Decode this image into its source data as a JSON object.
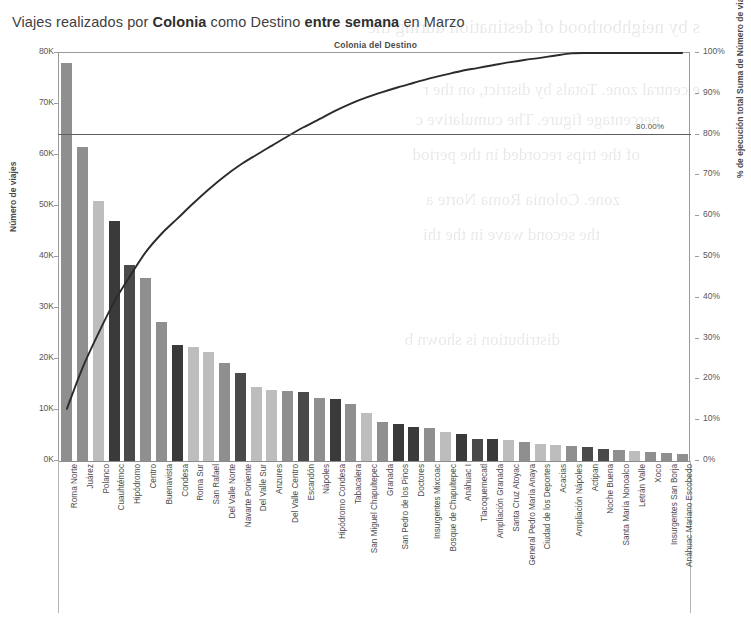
{
  "title": {
    "prefix": "Viajes realizados por ",
    "bold1": "Colonia",
    "mid": " como Destino ",
    "bold2": "entre semana",
    "suffix": " en Marzo"
  },
  "axes": {
    "top_subtitle": "Colonia del Destino",
    "left_title": "Número de viajes",
    "right_title": "% de ejecución total Suma de Número de viajes",
    "left_ticks": [
      "80K",
      "70K",
      "60K",
      "50K",
      "40K",
      "30K",
      "20K",
      "10K",
      "0K"
    ],
    "right_ticks": [
      "100%",
      "90%",
      "80%",
      "70%",
      "60%",
      "50%",
      "40%",
      "30%",
      "20%",
      "10%",
      "0%"
    ]
  },
  "reference_line": {
    "label": "80.00%",
    "value": 80
  },
  "colors": {
    "bar_light": "#bdbdbd",
    "bar_mid": "#8f8f8f",
    "bar_dark": "#4a4a4a",
    "bar_darkest": "#3a3a3a",
    "curve": "#2b2b2b",
    "axis": "#9a9a9a",
    "text": "#4b4b4b"
  },
  "chart_data": {
    "type": "bar",
    "title": "Viajes realizados por Colonia como Destino entre semana en Marzo",
    "subtitle": "Colonia del Destino",
    "xlabel": "Colonia del Destino",
    "ylabel": "Número de viajes",
    "y2label": "% de ejecución total Suma de Número de viajes",
    "ylim": [
      0,
      80000
    ],
    "y2lim": [
      0,
      100
    ],
    "grid": false,
    "legend": "none",
    "annotations": [
      "80.00%"
    ],
    "categories": [
      "Roma Norte",
      "Juárez",
      "Polanco",
      "Cuauhtémoc",
      "Hipódromo",
      "Centro",
      "Buenavista",
      "Condesa",
      "Roma Sur",
      "San Rafael",
      "Del Valle Norte",
      "Navarte Poniente",
      "Del Valle Sur",
      "Anzures",
      "Del Valle Centro",
      "Escandón",
      "Nápoles",
      "Hipódromo Condesa",
      "Tabacalera",
      "San Miguel Chapultepec",
      "Granada",
      "San Pedro de los Pinos",
      "Doctores",
      "Insurgentes Mixcoac",
      "Bosque de Chapultepec",
      "Anáhuac I",
      "Tlacoquemecatl",
      "Ampliación Granada",
      "Santa Cruz Atoyac",
      "General Pedro María Anaya",
      "Ciudad de los Deportes",
      "Acacias",
      "Ampliación Nápoles",
      "Actipan",
      "Noche Buena",
      "Santa María Nonoalco",
      "Letrán Valle",
      "Xoco",
      "Insurgentes San Borja",
      "Anáhuac Mariano Escobedo"
    ],
    "values": [
      78000,
      61500,
      51000,
      47000,
      38500,
      35800,
      27300,
      22700,
      22300,
      21300,
      19300,
      17300,
      14500,
      14000,
      13700,
      13600,
      12300,
      12200,
      11100,
      9400,
      7600,
      7300,
      6700,
      6500,
      5700,
      5200,
      4400,
      4300,
      4100,
      3800,
      3400,
      3200,
      3000,
      2700,
      2400,
      2100,
      1900,
      1700,
      1500,
      1300
    ],
    "series": [
      {
        "name": "Número de viajes",
        "type": "bar",
        "axis": "left",
        "values": [
          78000,
          61500,
          51000,
          47000,
          38500,
          35800,
          27300,
          22700,
          22300,
          21300,
          19300,
          17300,
          14500,
          14000,
          13700,
          13600,
          12300,
          12200,
          11100,
          9400,
          7600,
          7300,
          6700,
          6500,
          5700,
          5200,
          4400,
          4300,
          4100,
          3800,
          3400,
          3200,
          3000,
          2700,
          2400,
          2100,
          1900,
          1700,
          1500,
          1300
        ]
      },
      {
        "name": "% de ejecución total Suma de Número de viajes",
        "type": "line",
        "axis": "right",
        "values": [
          12.8,
          22.9,
          31.3,
          39.0,
          45.3,
          51.2,
          55.7,
          59.4,
          63.1,
          66.6,
          69.8,
          72.6,
          75.0,
          77.3,
          79.6,
          81.8,
          83.8,
          85.8,
          87.6,
          89.1,
          90.4,
          91.6,
          92.7,
          93.8,
          94.7,
          95.6,
          96.3,
          97.0,
          97.7,
          98.3,
          98.8,
          99.4,
          99.9,
          100.0,
          100.0,
          100.0,
          100.0,
          100.0,
          100.0,
          100.0
        ]
      }
    ],
    "bar_shades": [
      "mid",
      "mid",
      "light",
      "darkest",
      "dark",
      "mid",
      "mid",
      "darkest",
      "light",
      "light",
      "mid",
      "dark",
      "light",
      "light",
      "mid",
      "dark",
      "mid",
      "darkest",
      "mid",
      "light",
      "mid",
      "darkest",
      "darkest",
      "mid",
      "light",
      "darkest",
      "dark",
      "darkest",
      "light",
      "mid",
      "light",
      "light",
      "mid",
      "dark",
      "dark",
      "mid",
      "light",
      "mid",
      "mid",
      "mid"
    ]
  },
  "ghost_text": [
    "s by neighborhood of destination during the",
    "e central zone. Totals by district, on the r",
    "percentage figure. The cumulative c",
    "of the trips recorded in the period",
    "zone. Colonia Roma Norte a",
    "the second wave in the thi",
    "distribution is shown b"
  ]
}
